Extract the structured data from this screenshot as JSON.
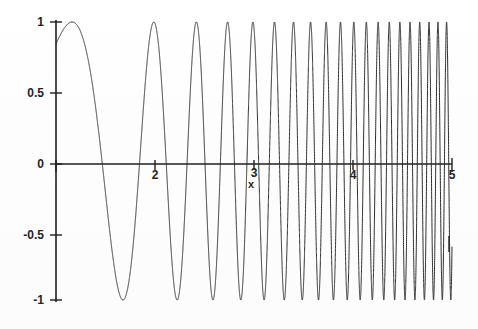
{
  "chart_data": {
    "type": "line",
    "title": "",
    "subtitle": "",
    "xlabel": "x",
    "ylabel": "",
    "xlim": [
      1,
      5
    ],
    "ylim": [
      -1,
      1
    ],
    "grid": false,
    "legend": null,
    "legend_position": "none",
    "series": [
      {
        "name": "sin(x^3)",
        "expression": "sin(x*x*x)",
        "color": "#2b2b2b",
        "line_width": 1,
        "x_start": 1,
        "x_end": 5,
        "amplitude": 1,
        "samples": 14000
      }
    ],
    "x_ticks": [
      {
        "value": 1,
        "label": ""
      },
      {
        "value": 2,
        "label": "2"
      },
      {
        "value": 3,
        "label": "3"
      },
      {
        "value": 4,
        "label": "4"
      },
      {
        "value": 5,
        "label": "5"
      }
    ],
    "y_ticks": [
      {
        "value": 1,
        "label": "1"
      },
      {
        "value": 0.5,
        "label": "0.5"
      },
      {
        "value": 0,
        "label": "0"
      },
      {
        "value": -0.5,
        "label": "-0.5"
      },
      {
        "value": -1,
        "label": "-1"
      }
    ],
    "peaks_x": [
      1.16,
      1.92,
      2.37,
      2.72,
      3.0,
      3.25,
      3.47,
      3.67,
      3.85,
      4.02,
      4.18,
      4.33,
      4.47,
      4.61,
      4.74,
      4.86,
      4.98
    ],
    "axis_color": "#1f1f1f",
    "curve_color": "#2b2b2b",
    "background_color": "#ffffff"
  },
  "axis_labels": {
    "y": {
      "one": "1",
      "half": "0.5",
      "zero": "0",
      "neg_half": "-0.5",
      "neg_one": "-1"
    },
    "x": {
      "t1": "",
      "t2": "2",
      "t3": "3",
      "t4": "4",
      "t5": "5",
      "title": "x"
    }
  }
}
